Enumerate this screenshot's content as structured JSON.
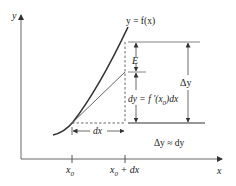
{
  "diagram": {
    "axes": {
      "x_label": "x",
      "y_label": "y"
    },
    "curve_label": "y = f(x)",
    "error_label": "E",
    "delta_y_label": "Δy",
    "dy_label_part1": "dy = f ′(x",
    "dy_label_sub": "0",
    "dy_label_part2": ")dx",
    "dx_label": "dx",
    "approx_label": "Δy ≈ dy",
    "ticks": {
      "x0_main": "x",
      "x0_sub": "0",
      "x0dx_main": "x",
      "x0dx_sub": "0",
      "x0dx_suffix": " + dx"
    },
    "colors": {
      "curve": "#333333",
      "lines": "#555555",
      "text": "#222222"
    }
  }
}
